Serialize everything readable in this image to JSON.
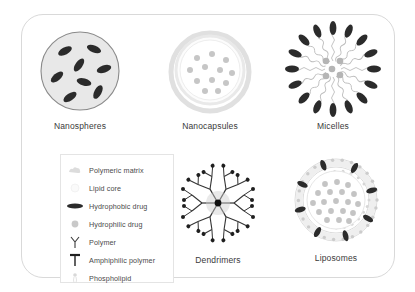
{
  "figure": {
    "background_color": "#ffffff",
    "frame_border_color": "#d9d9d9"
  },
  "colors": {
    "polymeric_matrix": "#e8e8e8",
    "matrix_outline": "#8a8a8a",
    "hydrophobic_drug": "#2b2b2b",
    "hydrophilic_drug": "#bdbdbd",
    "shell_light": "#ededed",
    "label_text": "#3a3a3a",
    "legend_text": "#4a4a4a",
    "legend_border": "#e4e4e4"
  },
  "diagrams": [
    {
      "id": "nanospheres",
      "label": "Nanospheres",
      "description": "Solid polymeric matrix sphere with hydrophobic drug dispersed throughout",
      "hydrophobic_drug_count": 8,
      "hydrophilic_drug_count": 0
    },
    {
      "id": "nanocapsules",
      "label": "Nanocapsules",
      "description": "Polymeric shell enclosing a liquid core containing hydrophilic drug",
      "hydrophobic_drug_count": 0,
      "hydrophilic_drug_count": 12
    },
    {
      "id": "micelles",
      "label": "Micelles",
      "description": "Amphiphilic polymer assembly with hydrophobic drug in the outer corona and hydrophilic drug in the core",
      "hydrophobic_drug_count": 16,
      "hydrophilic_drug_count": 5
    },
    {
      "id": "dendrimers",
      "label": "Dendrimers",
      "description": "Hyperbranched polymer radiating from a central core with drug at branch termini",
      "branch_generations": 3,
      "hydrophobic_drug_count": 24
    },
    {
      "id": "liposomes",
      "label": "Liposomes",
      "description": "Phospholipid bilayer vesicle with hydrophobic drug in the membrane and hydrophilic drug in the aqueous core",
      "hydrophobic_drug_count": 8,
      "hydrophilic_drug_count": 19
    }
  ],
  "legend": {
    "items": [
      {
        "icon": "polymeric-matrix-icon",
        "label": "Polymeric matrix"
      },
      {
        "icon": "lipid-core-icon",
        "label": "Lipid core"
      },
      {
        "icon": "hydrophobic-drug-icon",
        "label": "Hydrophobic drug"
      },
      {
        "icon": "hydrophilic-drug-icon",
        "label": "Hydrophilic drug"
      },
      {
        "icon": "polymer-icon",
        "label": "Polymer"
      },
      {
        "icon": "amphiphilic-polymer-icon",
        "label": "Amphiphilic polymer"
      },
      {
        "icon": "phospholipid-icon",
        "label": "Phospholipid"
      }
    ]
  }
}
